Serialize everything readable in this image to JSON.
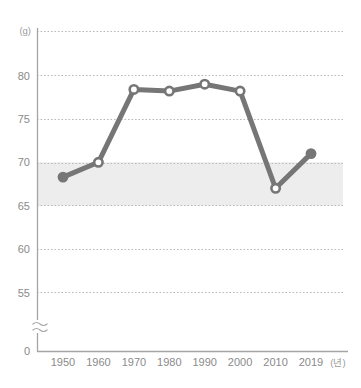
{
  "chart_data": {
    "type": "line",
    "title": "",
    "subtitle": "",
    "xlabel": "(년)",
    "ylabel": "(g)",
    "x": [
      1950,
      1960,
      1970,
      1980,
      1990,
      2000,
      2010,
      2019
    ],
    "categories": [
      "1950",
      "1960",
      "1970",
      "1980",
      "1990",
      "2000",
      "2010",
      "2019"
    ],
    "values": [
      68.3,
      70.0,
      78.4,
      78.2,
      79.0,
      78.2,
      67.0,
      71.0
    ],
    "series": [
      {
        "name": "",
        "values": [
          68.3,
          70.0,
          78.4,
          78.2,
          79.0,
          78.2,
          67.0,
          71.0
        ],
        "color": "#767676",
        "marker_open": [
          false,
          true,
          true,
          true,
          true,
          true,
          true,
          false
        ]
      }
    ],
    "ylim": [
      55,
      82.5
    ],
    "y_ticks": [
      55,
      60,
      65,
      70,
      75,
      80
    ],
    "y_tick_labels": [
      "55",
      "60",
      "65",
      "70",
      "75",
      "80"
    ],
    "y_zero_label": "0",
    "axis_break": "≈",
    "grid": true,
    "grid_style": "dotted",
    "grid_color": "#b9b9b9",
    "legend": "none",
    "shaded_band": {
      "from": 65,
      "to": 70,
      "color": "#ededed",
      "label": ""
    },
    "axis_color": "#a5a5a5",
    "line_color": "#767676",
    "marker_fill_open": "#ffffff",
    "background": "#ffffff"
  },
  "axis": {
    "y_unit": "(g)",
    "x_unit": "(년)",
    "zero_label": "0",
    "break_symbol": "≈"
  },
  "y_ticks": [
    {
      "label": "80",
      "value": 80
    },
    {
      "label": "75",
      "value": 75
    },
    {
      "label": "70",
      "value": 70
    },
    {
      "label": "65",
      "value": 65
    },
    {
      "label": "60",
      "value": 60
    },
    {
      "label": "55",
      "value": 55
    }
  ],
  "x_ticks": [
    {
      "label": "1950"
    },
    {
      "label": "1960"
    },
    {
      "label": "1970"
    },
    {
      "label": "1980"
    },
    {
      "label": "1990"
    },
    {
      "label": "2000"
    },
    {
      "label": "2010"
    },
    {
      "label": "2019"
    }
  ]
}
